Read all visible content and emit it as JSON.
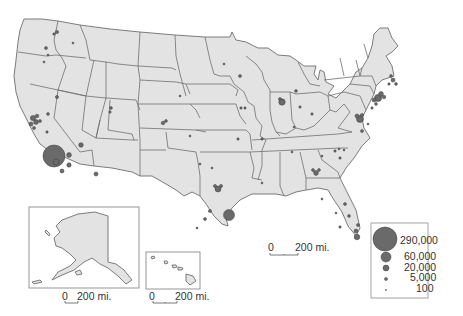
{
  "map": {
    "type": "proportional-symbol map",
    "region": "United States",
    "fill_color": "#e3e3e3",
    "border_color": "#6e6e6e",
    "symbol_color": "#6a6a6a"
  },
  "scale_bars": {
    "main": {
      "zero": "0",
      "label": "200 mi."
    },
    "alaska": {
      "zero": "0",
      "label": "200 mi."
    },
    "hawaii": {
      "zero": "0",
      "label": "200 mi."
    }
  },
  "legend": {
    "items": [
      {
        "value": "290,000"
      },
      {
        "value": "60,000"
      },
      {
        "value": "20,000"
      },
      {
        "value": "5,000"
      },
      {
        "value": "100"
      }
    ]
  },
  "insets": {
    "alaska": "Alaska",
    "hawaii": "Hawaii"
  }
}
